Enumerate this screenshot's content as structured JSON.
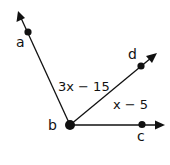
{
  "diagram": {
    "type": "angle-rays",
    "colors": {
      "stroke": "#111111",
      "background": "#ffffff"
    },
    "vertex": {
      "label": "b",
      "x": 70,
      "y": 125
    },
    "rays": [
      {
        "id": "ba",
        "point_label": "a",
        "point": {
          "x": 28,
          "y": 32
        },
        "tip": {
          "x": 18,
          "y": 12
        }
      },
      {
        "id": "bd",
        "point_label": "d",
        "point": {
          "x": 141,
          "y": 66
        },
        "tip": {
          "x": 156,
          "y": 54
        }
      },
      {
        "id": "bc",
        "point_label": "c",
        "point": {
          "x": 142,
          "y": 125
        },
        "tip": {
          "x": 164,
          "y": 125
        }
      }
    ],
    "angle_labels": [
      {
        "id": "angle-abd",
        "text": "3x − 15"
      },
      {
        "id": "angle-dbc",
        "text": "x − 5"
      }
    ]
  }
}
